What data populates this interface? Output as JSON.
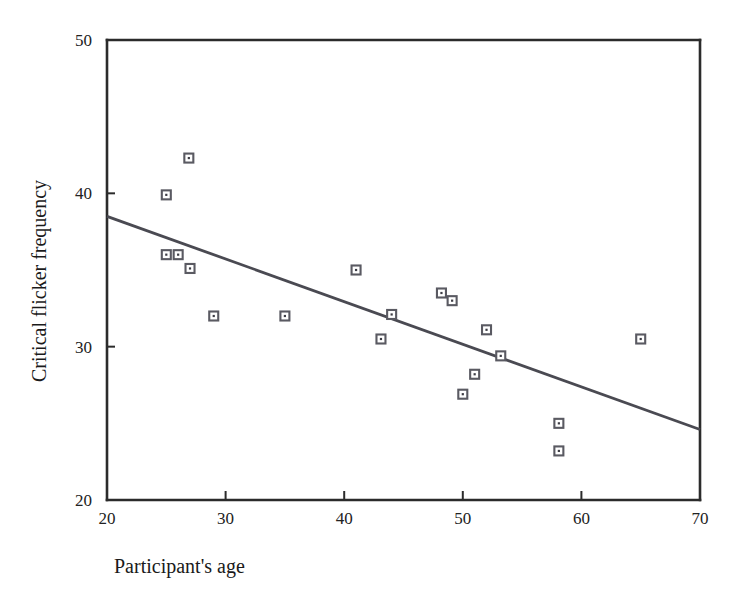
{
  "chart_data": {
    "type": "scatter",
    "title": "",
    "subtitle": "",
    "xlabel": "Participant's age",
    "ylabel": "Critical flicker frequency",
    "xlim": [
      20,
      70
    ],
    "ylim": [
      20,
      50
    ],
    "xticks": [
      20,
      30,
      40,
      50,
      60,
      70
    ],
    "yticks": [
      20,
      30,
      40,
      50
    ],
    "xtick_labels": [
      "20",
      "30",
      "40",
      "50",
      "60",
      "70"
    ],
    "ytick_labels": [
      "20",
      "30",
      "40",
      "50"
    ],
    "grid": false,
    "legend": null,
    "marker_style": "open-square-with-center-dot",
    "series": [
      {
        "name": "participants",
        "type": "scatter",
        "points": [
          {
            "x": 25.0,
            "y": 39.9
          },
          {
            "x": 26.9,
            "y": 42.3
          },
          {
            "x": 25.0,
            "y": 36.0
          },
          {
            "x": 26.0,
            "y": 36.0
          },
          {
            "x": 27.0,
            "y": 35.1
          },
          {
            "x": 29.0,
            "y": 32.0
          },
          {
            "x": 35.0,
            "y": 32.0
          },
          {
            "x": 41.0,
            "y": 35.0
          },
          {
            "x": 43.1,
            "y": 30.5
          },
          {
            "x": 44.0,
            "y": 32.1
          },
          {
            "x": 48.2,
            "y": 33.5
          },
          {
            "x": 49.1,
            "y": 33.0
          },
          {
            "x": 50.0,
            "y": 26.9
          },
          {
            "x": 51.0,
            "y": 28.2
          },
          {
            "x": 52.0,
            "y": 31.1
          },
          {
            "x": 53.2,
            "y": 29.4
          },
          {
            "x": 58.1,
            "y": 25.0
          },
          {
            "x": 58.1,
            "y": 23.2
          },
          {
            "x": 65.0,
            "y": 30.5
          }
        ]
      },
      {
        "name": "regression-line",
        "type": "line",
        "points": [
          {
            "x": 20.0,
            "y": 38.5
          },
          {
            "x": 70.0,
            "y": 24.6
          }
        ]
      }
    ],
    "colors": {
      "axis": "#2b2b2b",
      "marker_stroke": "#5a5a62",
      "marker_fill": "#ffffff",
      "marker_dot": "#3c3c44",
      "trend_line": "#4a4a52",
      "background": "#ffffff",
      "text": "#1a1a1a"
    }
  }
}
